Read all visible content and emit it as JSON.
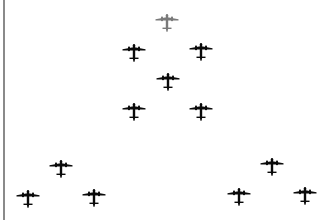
{
  "scene": {
    "description": "Formation of aircraft silhouettes",
    "colors": {
      "lead": "#7a7a7a",
      "formation": "#0a0a0a",
      "rule": "#8a8a8a",
      "background": "#ffffff"
    },
    "planes": [
      {
        "id": "lead",
        "x": 167,
        "y": 19,
        "color": "lead"
      },
      {
        "id": "row2-left",
        "x": 134,
        "y": 49,
        "color": "formation"
      },
      {
        "id": "row2-right",
        "x": 201,
        "y": 48,
        "color": "formation"
      },
      {
        "id": "center",
        "x": 168,
        "y": 78,
        "color": "formation"
      },
      {
        "id": "row4-left",
        "x": 134,
        "y": 108,
        "color": "formation"
      },
      {
        "id": "row4-right",
        "x": 201,
        "y": 108,
        "color": "formation"
      },
      {
        "id": "left-top",
        "x": 61,
        "y": 165,
        "color": "formation"
      },
      {
        "id": "left-bottom-left",
        "x": 28,
        "y": 195,
        "color": "formation"
      },
      {
        "id": "left-bottom-right",
        "x": 94,
        "y": 194,
        "color": "formation"
      },
      {
        "id": "right-top",
        "x": 272,
        "y": 163,
        "color": "formation"
      },
      {
        "id": "right-bottom-left",
        "x": 239,
        "y": 193,
        "color": "formation"
      },
      {
        "id": "right-bottom-right",
        "x": 305,
        "y": 192,
        "color": "formation"
      }
    ]
  }
}
